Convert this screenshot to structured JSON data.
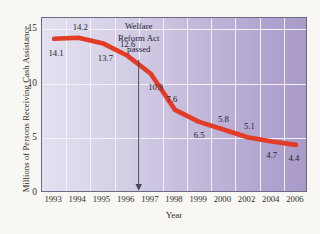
{
  "chart_data": {
    "type": "line",
    "title": "",
    "xlabel": "Year",
    "ylabel": "Millions of Persons Receiving Cash Assistance",
    "categories": [
      "1993",
      "1994",
      "1995",
      "1996",
      "1997",
      "1998",
      "1999",
      "2000",
      "2002",
      "2004",
      "2006"
    ],
    "values": [
      14.1,
      14.2,
      13.7,
      12.6,
      10.9,
      7.6,
      6.5,
      5.8,
      5.1,
      4.7,
      4.4
    ],
    "point_labels": [
      "14.1",
      "14.2",
      "13.7",
      "12.6",
      "10.9",
      "7.6",
      "6.5",
      "5.8",
      "5.1",
      "4.7",
      "4.4"
    ],
    "ylim": [
      0,
      16
    ],
    "yticks": [
      "0",
      "5",
      "10",
      "15"
    ],
    "ytick_values": [
      0,
      5,
      10,
      15
    ],
    "grid": true,
    "legend": "none",
    "series_color": "#e23b26",
    "plot_background_left": "#e3e0ef",
    "plot_background_right": "#a99ac9",
    "gridline_color": "#f3f2f8",
    "frame_color": "#6e6a86",
    "annotations": [
      {
        "name": "welfare-reform-act-annotation",
        "lines": [
          "Welfare",
          "Reform Act",
          "passed"
        ],
        "line1": "Welfare",
        "line2": "Reform Act",
        "line3": "passed",
        "arrow_x_year": 1996.5,
        "arrow_color": "#4a4558"
      }
    ]
  },
  "figure": {
    "axis_x_title": "Year",
    "axis_y_title": "Millions of Persons Receiving Cash Assistance"
  }
}
